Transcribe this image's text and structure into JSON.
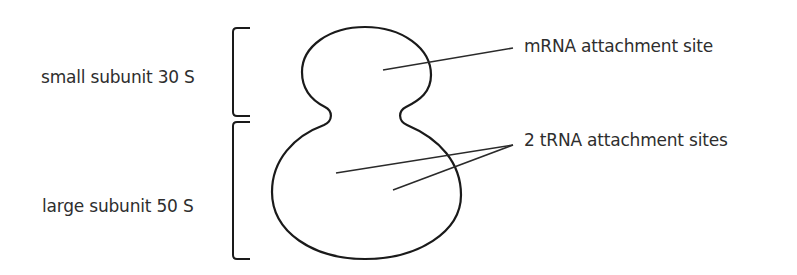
{
  "diagram": {
    "labels": {
      "small_subunit": "small subunit 30 S",
      "large_subunit": "large subunit 50 S",
      "mrna_site": "mRNA attachment site",
      "trna_sites": "2 tRNA attachment sites"
    },
    "colors": {
      "stroke": "#1a1a1a",
      "text": "#2e2e2e",
      "background": "#ffffff"
    }
  }
}
